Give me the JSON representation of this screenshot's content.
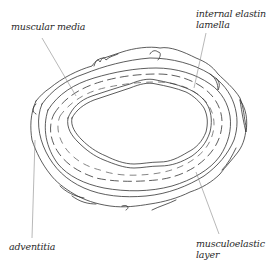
{
  "diagram": {
    "colors": {
      "background": "#ffffff",
      "ink": "#333333",
      "leader_line": "#888888"
    },
    "labels": [
      {
        "id": "muscular_media",
        "text_lines": [
          "muscular media"
        ],
        "position": "top-left"
      },
      {
        "id": "internal_elastin_lamella",
        "text_lines": [
          "internal elastin",
          "lamella"
        ],
        "position": "top-right"
      },
      {
        "id": "adventitia",
        "text_lines": [
          "adventitia"
        ],
        "position": "bottom-left"
      },
      {
        "id": "musculoelastic_layer",
        "text_lines": [
          "musculoelastic",
          "layer"
        ],
        "position": "bottom-right"
      }
    ]
  },
  "labels": {
    "muscular_media": "muscular media",
    "internal_elastin_line1": "internal elastin",
    "internal_elastin_line2": "lamella",
    "adventitia": "adventitia",
    "musculoelastic_line1": "musculoelastic",
    "musculoelastic_line2": "layer"
  }
}
